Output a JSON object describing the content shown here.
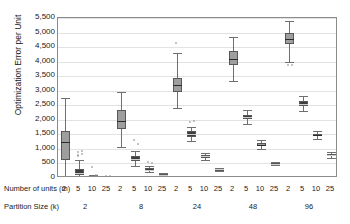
{
  "chart_data": {
    "type": "box",
    "title": "",
    "xlabel": "Number of units (m) / Partition Size (k)",
    "ylabel": "Optimization Error per Unit",
    "ylim": [
      0,
      5500
    ],
    "ytick_labels": [
      "5,500",
      "5,000",
      "4,500",
      "4,000",
      "3,500",
      "3,000",
      "2,500",
      "2,000",
      "1,500",
      "1,000",
      "500",
      "0"
    ],
    "ytick_values": [
      5500,
      5000,
      4500,
      4000,
      3500,
      3000,
      2500,
      2000,
      1500,
      1000,
      500,
      0
    ],
    "grid": true,
    "legend": "none",
    "axis_row_labels": {
      "units": "Number of units (m)",
      "partition": "Partition Size (k)"
    },
    "units_categories": [
      "2",
      "5",
      "10",
      "25"
    ],
    "partition_categories": [
      "2",
      "8",
      "24",
      "48",
      "96"
    ],
    "groups": [
      {
        "partition_size": "2",
        "boxes": [
          {
            "m": "2",
            "min": 60,
            "q1": 620,
            "median": 1230,
            "q3": 1600,
            "max": 2750,
            "outliers": [
              1330
            ],
            "shade": "light"
          },
          {
            "m": "5",
            "min": 30,
            "q1": 105,
            "median": 170,
            "q3": 320,
            "max": 620,
            "outliers": [
              900,
              930,
              790,
              820,
              760
            ],
            "shade": "dark"
          },
          {
            "m": "10",
            "min": 15,
            "q1": 30,
            "median": 45,
            "q3": 70,
            "max": 110,
            "outliers": [
              380,
              90
            ],
            "shade": "dark"
          },
          {
            "m": "25",
            "min": 5,
            "q1": 12,
            "median": 18,
            "q3": 26,
            "max": 40,
            "outliers": [
              55,
              60
            ],
            "shade": "dark"
          }
        ]
      },
      {
        "partition_size": "8",
        "boxes": [
          {
            "m": "2",
            "min": 1080,
            "q1": 1680,
            "median": 1960,
            "q3": 2340,
            "max": 2950,
            "outliers": [],
            "shade": "light"
          },
          {
            "m": "5",
            "min": 420,
            "q1": 580,
            "median": 660,
            "q3": 760,
            "max": 930,
            "outliers": [
              1290,
              1160
            ],
            "shade": "dark"
          },
          {
            "m": "10",
            "min": 190,
            "q1": 250,
            "median": 290,
            "q3": 330,
            "max": 420,
            "outliers": [
              560,
              520
            ],
            "shade": "dark"
          },
          {
            "m": "25",
            "min": 70,
            "q1": 95,
            "median": 110,
            "q3": 130,
            "max": 160,
            "outliers": [],
            "shade": "dark"
          }
        ]
      },
      {
        "partition_size": "24",
        "boxes": [
          {
            "m": "2",
            "min": 2400,
            "q1": 2950,
            "median": 3200,
            "q3": 3450,
            "max": 4300,
            "outliers": [
              4650
            ],
            "shade": "light"
          },
          {
            "m": "5",
            "min": 1280,
            "q1": 1420,
            "median": 1500,
            "q3": 1600,
            "max": 1760,
            "outliers": [
              1930,
              1960
            ],
            "shade": "dark"
          },
          {
            "m": "10",
            "min": 620,
            "q1": 700,
            "median": 750,
            "q3": 790,
            "max": 870,
            "outliers": [],
            "shade": "dark"
          },
          {
            "m": "25",
            "min": 250,
            "q1": 280,
            "median": 300,
            "q3": 320,
            "max": 350,
            "outliers": [],
            "shade": "dark"
          }
        ]
      },
      {
        "partition_size": "48",
        "boxes": [
          {
            "m": "2",
            "min": 3350,
            "q1": 3900,
            "median": 4100,
            "q3": 4350,
            "max": 4850,
            "outliers": [],
            "shade": "light"
          },
          {
            "m": "5",
            "min": 1850,
            "q1": 2020,
            "median": 2100,
            "q3": 2180,
            "max": 2330,
            "outliers": [],
            "shade": "dark"
          },
          {
            "m": "10",
            "min": 1010,
            "q1": 1100,
            "median": 1140,
            "q3": 1200,
            "max": 1290,
            "outliers": [],
            "shade": "light"
          },
          {
            "m": "25",
            "min": 430,
            "q1": 470,
            "median": 490,
            "q3": 510,
            "max": 550,
            "outliers": [],
            "shade": "dark"
          }
        ]
      },
      {
        "partition_size": "96",
        "boxes": [
          {
            "m": "2",
            "min": 4000,
            "q1": 4600,
            "median": 4780,
            "q3": 4980,
            "max": 5400,
            "outliers": [
              3880,
              3870
            ],
            "shade": "light"
          },
          {
            "m": "5",
            "min": 2300,
            "q1": 2480,
            "median": 2560,
            "q3": 2650,
            "max": 2830,
            "outliers": [],
            "shade": "dark"
          },
          {
            "m": "10",
            "min": 1340,
            "q1": 1430,
            "median": 1470,
            "q3": 1520,
            "max": 1620,
            "outliers": [],
            "shade": "light"
          },
          {
            "m": "25",
            "min": 700,
            "q1": 760,
            "median": 790,
            "q3": 820,
            "max": 880,
            "outliers": [],
            "shade": "dark"
          }
        ]
      }
    ]
  },
  "colors": {
    "box_light": "#9e9e9e",
    "box_dark": "#3d3d3d",
    "whisker": "#6f6f6f",
    "median": "#2b2b2b",
    "grid": "#e2e2e2",
    "axis": "#8c8c8c"
  }
}
